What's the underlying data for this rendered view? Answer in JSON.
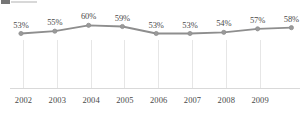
{
  "chart_data": {
    "type": "line",
    "title": "",
    "subtitle": "",
    "xlabel": "",
    "ylabel": "",
    "grid": "vertical",
    "legend_position": "none",
    "categories": [
      "2002",
      "2003",
      "2004",
      "2005",
      "2006",
      "2007",
      "2008",
      "2009",
      ""
    ],
    "x_tick_labels": [
      "2002",
      "2003",
      "2004",
      "2005",
      "2006",
      "2007",
      "2008",
      "2009"
    ],
    "values": [
      53,
      55,
      60,
      59,
      53,
      53,
      54,
      57,
      58
    ],
    "data_labels": [
      "53%",
      "55%",
      "60%",
      "59%",
      "53%",
      "53%",
      "54%",
      "57%",
      "58%"
    ],
    "ylim": [
      50,
      62
    ],
    "y_axis_visible": false,
    "series": [
      {
        "name": "series-1",
        "values": [
          53,
          55,
          60,
          59,
          53,
          53,
          54,
          57,
          58
        ],
        "color": "#8e8e8e",
        "marker_color": "#9a9a9a"
      }
    ],
    "colors": {
      "line": "#8e8e8e",
      "marker": "#9a9a9a",
      "gridline": "#e6e6e6",
      "axis": "#d9d9d9",
      "label_text": "#4a4a4a",
      "background": "#ffffff",
      "legend_swatch": "#5e5e5e"
    }
  },
  "legend": {
    "swatch_name": "legend-color-swatch",
    "label": ""
  }
}
